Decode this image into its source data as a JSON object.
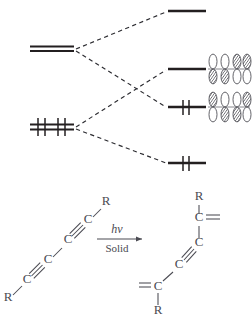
{
  "figure": {
    "background_color": "#ffffff",
    "line_color": "#231f20",
    "text_color": "#4a4a52",
    "orbital_fill_empty": "#ffffff",
    "orbital_fill_shaded": "#6e6e76"
  },
  "mo_diagram": {
    "name": "orbital-correlation-diagram",
    "left_side": {
      "label": "monomer levels",
      "levels": [
        {
          "name": "left-upper-degenerate-pair",
          "occupancy": "empty",
          "electrons": 0,
          "degeneracy": 2,
          "x": 30,
          "y": 48,
          "width": 44
        },
        {
          "name": "left-lower-degenerate-pair",
          "occupancy": "filled",
          "electrons": 4,
          "degeneracy": 2,
          "x": 30,
          "y": 126,
          "width": 44
        }
      ]
    },
    "right_side": {
      "label": "polymer levels",
      "levels": [
        {
          "name": "right-level-1-lumo-plus",
          "occupancy": "empty",
          "electrons": 0,
          "x": 168,
          "y": 11,
          "width": 38,
          "orbitals": null
        },
        {
          "name": "right-level-2-lumo",
          "occupancy": "empty",
          "electrons": 0,
          "x": 168,
          "y": 69,
          "width": 38,
          "orbitals": {
            "count": 4,
            "label": "lumo-p-orbital-array",
            "phases": [
              "down",
              "down",
              "up",
              "up"
            ]
          }
        },
        {
          "name": "right-level-3-homo",
          "occupancy": "filled",
          "electrons": 2,
          "x": 168,
          "y": 107,
          "width": 38,
          "orbitals": {
            "count": 4,
            "label": "homo-p-orbital-array",
            "phases": [
              "up",
              "down",
              "down",
              "up"
            ]
          }
        },
        {
          "name": "right-level-4-homo-minus",
          "occupancy": "filled",
          "electrons": 2,
          "x": 168,
          "y": 163,
          "width": 38,
          "orbitals": null
        }
      ]
    },
    "correlation_lines": [
      {
        "name": "correlation-line-upper-to-top",
        "from": "left-upper",
        "to": "right-level-1",
        "style": "dashed"
      },
      {
        "name": "correlation-line-upper-to-homo",
        "from": "left-upper",
        "to": "right-level-3",
        "style": "dashed"
      },
      {
        "name": "correlation-line-lower-to-lumo",
        "from": "left-lower",
        "to": "right-level-2",
        "style": "dashed"
      },
      {
        "name": "correlation-line-lower-to-bottom",
        "from": "left-lower",
        "to": "right-level-4",
        "style": "dashed"
      }
    ]
  },
  "reaction_scheme": {
    "name": "photopolymerization-scheme",
    "reactant": {
      "name": "diacetylene-monomer",
      "formula": "R-C≡C-C≡C-R",
      "atom_labels": [
        "R",
        "C",
        "C",
        "C",
        "C",
        "R"
      ],
      "substituent_label": "R",
      "carbon_label": "C",
      "bonds": [
        "triple",
        "single",
        "triple"
      ]
    },
    "conditions": {
      "name": "reaction-conditions",
      "above_arrow": "hν",
      "below_arrow": "Solid",
      "arrow_direction": "right"
    },
    "product": {
      "name": "polydiacetylene-repeat-unit",
      "formula": "=C(R)-C≡C-C(R)=",
      "atom_labels": [
        "C",
        "C",
        "C",
        "C"
      ],
      "substituent_label": "R",
      "carbon_label": "C",
      "bonds": [
        "double",
        "single",
        "triple",
        "single",
        "double"
      ]
    }
  }
}
